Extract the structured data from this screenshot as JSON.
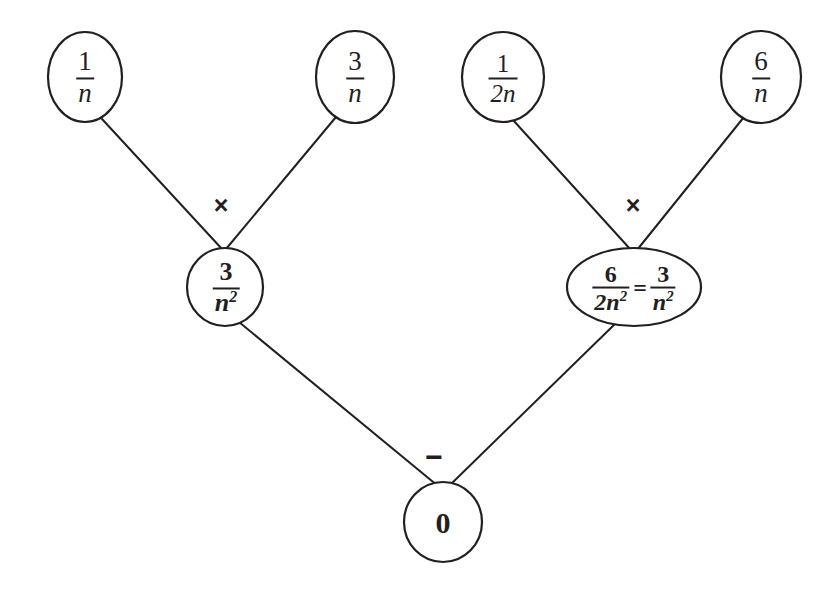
{
  "diagram": {
    "type": "expression-tree",
    "background_color": "#ffffff",
    "stroke_color": "#231f20",
    "nodes": [
      {
        "id": "leaf-1-over-n",
        "role": "leaf",
        "shape": "circle",
        "numerator": "1",
        "denominator": "n",
        "text": "1/n",
        "cx": 85,
        "cy": 77,
        "rx": 37,
        "ry": 45
      },
      {
        "id": "leaf-3-over-n",
        "role": "leaf",
        "shape": "circle",
        "numerator": "3",
        "denominator": "n",
        "text": "3/n",
        "cx": 355,
        "cy": 77,
        "rx": 39,
        "ry": 46
      },
      {
        "id": "leaf-1-over-2n",
        "role": "leaf",
        "shape": "circle",
        "numerator": "1",
        "denominator": "2n",
        "text": "1/2n",
        "cx": 503,
        "cy": 77,
        "rx": 41,
        "ry": 45
      },
      {
        "id": "leaf-6-over-n",
        "role": "leaf",
        "shape": "circle",
        "numerator": "6",
        "denominator": "n",
        "text": "6/n",
        "cx": 761,
        "cy": 77,
        "rx": 40,
        "ry": 46
      },
      {
        "id": "inner-left-3-over-n2",
        "role": "internal",
        "shape": "circle",
        "numerator": "3",
        "denominator": "n",
        "denominator_exponent": "2",
        "text": "3/n^2",
        "cx": 225,
        "cy": 287,
        "rx": 38,
        "ry": 39
      },
      {
        "id": "inner-right-6-over-2n2",
        "role": "internal",
        "shape": "ellipse",
        "left_numerator": "6",
        "left_denominator": "2n",
        "left_denominator_exponent": "2",
        "equals": "=",
        "right_numerator": "3",
        "right_denominator": "n",
        "right_denominator_exponent": "2",
        "text": "6/2n^2 = 3/n^2",
        "cx": 634,
        "cy": 287,
        "rx": 67,
        "ry": 39
      },
      {
        "id": "root-zero",
        "role": "root",
        "shape": "circle",
        "text": "0",
        "cx": 443,
        "cy": 522,
        "rx": 39,
        "ry": 40
      }
    ],
    "operators": [
      {
        "id": "op-multiply-left",
        "symbol": "×",
        "name": "multiply",
        "x": 221,
        "y": 205
      },
      {
        "id": "op-multiply-right",
        "symbol": "×",
        "name": "multiply",
        "x": 633,
        "y": 205
      },
      {
        "id": "op-minus-root",
        "symbol": "−",
        "name": "subtract",
        "x": 434,
        "y": 457
      }
    ],
    "edges": [
      {
        "id": "edge-1-over-n-to-left-product",
        "from": "leaf-1-over-n",
        "to": "inner-left-3-over-n2",
        "x1": 102,
        "y1": 119,
        "x2": 222,
        "y2": 249
      },
      {
        "id": "edge-3-over-n-to-left-product",
        "from": "leaf-3-over-n",
        "to": "inner-left-3-over-n2",
        "x1": 336,
        "y1": 117,
        "x2": 226,
        "y2": 249
      },
      {
        "id": "edge-1-over-2n-to-right-product",
        "from": "leaf-1-over-2n",
        "to": "inner-right-6-over-2n2",
        "x1": 513,
        "y1": 120,
        "x2": 631,
        "y2": 250
      },
      {
        "id": "edge-6-over-n-to-right-product",
        "from": "leaf-6-over-n",
        "to": "inner-right-6-over-2n2",
        "x1": 744,
        "y1": 117,
        "x2": 637,
        "y2": 250
      },
      {
        "id": "edge-left-product-to-root",
        "from": "inner-left-3-over-n2",
        "to": "root-zero",
        "x1": 239,
        "y1": 322,
        "x2": 438,
        "y2": 486
      },
      {
        "id": "edge-right-product-to-root",
        "from": "inner-right-6-over-2n2",
        "to": "root-zero",
        "x1": 617,
        "y1": 322,
        "x2": 449,
        "y2": 486
      }
    ]
  }
}
